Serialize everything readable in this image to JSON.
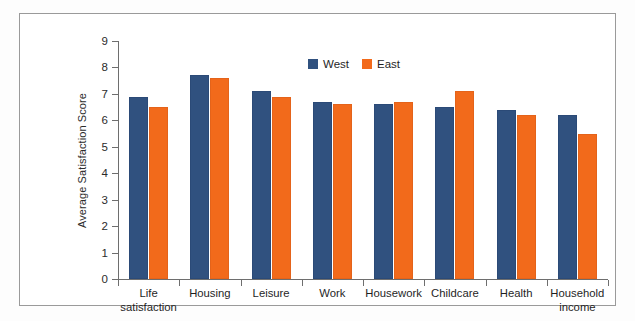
{
  "chart_data": {
    "type": "bar",
    "title": "",
    "subtitle": "",
    "xlabel": "",
    "ylabel": "Average Satisfaction Score",
    "ylim": [
      0,
      9
    ],
    "yticks": [
      0,
      1,
      2,
      3,
      4,
      5,
      6,
      7,
      8,
      9
    ],
    "ytick_labels": [
      "0",
      "1",
      "2",
      "3",
      "4",
      "5",
      "6",
      "7",
      "8",
      "9"
    ],
    "grid": false,
    "legend_position": "top-center",
    "categories": [
      "Life\nsatisfaction",
      "Housing",
      "Leisure",
      "Work",
      "Housework",
      "Childcare",
      "Health",
      "Household\nincome"
    ],
    "series": [
      {
        "name": "West",
        "color": "#30517f",
        "values": [
          6.9,
          7.7,
          7.1,
          6.7,
          6.6,
          6.5,
          6.4,
          6.2
        ]
      },
      {
        "name": "East",
        "color": "#f26a1b",
        "values": [
          6.5,
          7.6,
          6.9,
          6.6,
          6.7,
          7.1,
          6.2,
          5.5
        ]
      }
    ]
  },
  "legend": {
    "entries": [
      {
        "label": "West",
        "swatch": "legend-swatch-west"
      },
      {
        "label": "East",
        "swatch": "legend-swatch-east"
      }
    ]
  },
  "colors": {
    "west": "#30517f",
    "east": "#f26a1b",
    "axis": "#6e6e6e",
    "frame": "#9a9a9a",
    "text": "#1f1f1f",
    "background": "#ffffff"
  }
}
